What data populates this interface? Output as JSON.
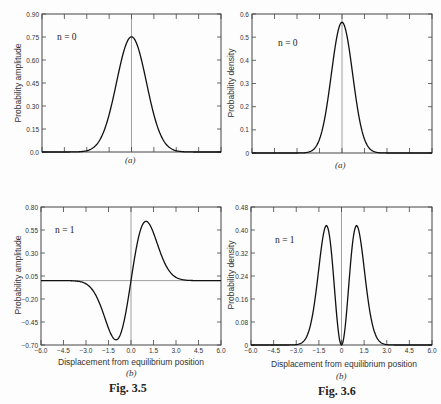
{
  "figures": {
    "left": {
      "caption": "Fig. 3.5"
    },
    "right": {
      "caption": "Fig. 3.6"
    }
  },
  "chart_data": [
    {
      "id": "fig3_5a",
      "type": "line",
      "panel": "(a)",
      "annotation": "n = 0",
      "xlabel": "",
      "ylabel": "Probability amplitude",
      "xlim": [
        -6.0,
        6.0
      ],
      "ylim": [
        0.0,
        0.9
      ],
      "yticks": [
        "0.0",
        "0.15",
        "0.30",
        "0.45",
        "0.60",
        "0.75",
        "0.90"
      ],
      "xticks": [
        -6.0,
        -4.5,
        -3.0,
        -1.5,
        0.0,
        1.5,
        3.0,
        4.5,
        6.0
      ],
      "xtick_labels_visible": false,
      "series": [
        {
          "name": "psi_0",
          "function": "0.7511*exp(-x^2/2)",
          "peak": {
            "x": 0.0,
            "y": 0.75
          },
          "x": [
            -4.0,
            -3.0,
            -2.5,
            -2.0,
            -1.5,
            -1.0,
            -0.5,
            0.0,
            0.5,
            1.0,
            1.5,
            2.0,
            2.5,
            3.0,
            4.0
          ],
          "values": [
            0.0,
            0.01,
            0.03,
            0.1,
            0.24,
            0.46,
            0.66,
            0.75,
            0.66,
            0.46,
            0.24,
            0.1,
            0.03,
            0.01,
            0.0
          ]
        }
      ],
      "reference_lines": [
        {
          "orientation": "vertical",
          "x": 0.0
        }
      ],
      "grid": false
    },
    {
      "id": "fig3_6a",
      "type": "line",
      "panel": "(a)",
      "annotation": "n = 0",
      "xlabel": "",
      "ylabel": "Probability density",
      "xlim": [
        -6.0,
        6.0
      ],
      "ylim": [
        0.0,
        0.6
      ],
      "yticks": [
        "0",
        "0.1",
        "0.2",
        "0.3",
        "0.4",
        "0.5",
        "0.6"
      ],
      "xticks": [
        -6.0,
        -4.5,
        -3.0,
        -1.5,
        0.0,
        1.5,
        3.0,
        4.5,
        6.0
      ],
      "xtick_labels_visible": false,
      "series": [
        {
          "name": "psi_0^2",
          "function": "0.5642*exp(-x^2)",
          "peak": {
            "x": 0.0,
            "y": 0.56
          },
          "x": [
            -3.0,
            -2.0,
            -1.5,
            -1.0,
            -0.5,
            0.0,
            0.5,
            1.0,
            1.5,
            2.0,
            3.0
          ],
          "values": [
            0.0,
            0.01,
            0.06,
            0.21,
            0.44,
            0.56,
            0.44,
            0.21,
            0.06,
            0.01,
            0.0
          ]
        }
      ],
      "reference_lines": [
        {
          "orientation": "vertical",
          "x": 0.0
        }
      ],
      "grid": false
    },
    {
      "id": "fig3_5b",
      "type": "line",
      "panel": "(b)",
      "annotation": "n = 1",
      "xlabel": "Displacement from equilibrium position",
      "ylabel": "Probability amplitude",
      "xlim": [
        -6.0,
        6.0
      ],
      "ylim": [
        -0.7,
        0.8
      ],
      "yticks": [
        "-0.70",
        "-0.45",
        "-0.20",
        "0.05",
        "0.30",
        "0.55",
        "0.80"
      ],
      "xticks": [
        "-6.0",
        "-4.5",
        "-3.0",
        "-1.5",
        "0.0",
        "1.5",
        "3.0",
        "4.5",
        "6.0"
      ],
      "series": [
        {
          "name": "psi_1",
          "function": "1.0623*x*exp(-x^2/2)",
          "min": {
            "x": -1.0,
            "y": -0.64
          },
          "max": {
            "x": 1.0,
            "y": 0.64
          },
          "x": [
            -4.0,
            -3.0,
            -2.5,
            -2.0,
            -1.5,
            -1.0,
            -0.5,
            0.0,
            0.5,
            1.0,
            1.5,
            2.0,
            2.5,
            3.0,
            4.0
          ],
          "values": [
            0.0,
            -0.04,
            -0.12,
            -0.29,
            -0.52,
            -0.64,
            -0.47,
            0.0,
            0.47,
            0.64,
            0.52,
            0.29,
            0.12,
            0.04,
            0.0
          ]
        }
      ],
      "reference_lines": [
        {
          "orientation": "vertical",
          "x": 0.0
        },
        {
          "orientation": "horizontal",
          "y": 0.0
        }
      ],
      "grid": false
    },
    {
      "id": "fig3_6b",
      "type": "line",
      "panel": "(b)",
      "annotation": "n = 1",
      "xlabel": "Displacement from equilibrium position",
      "ylabel": "Probability density",
      "xlim": [
        -6.0,
        6.0
      ],
      "ylim": [
        0.0,
        0.48
      ],
      "yticks": [
        "0",
        "0.08",
        "0.16",
        "0.24",
        "0.32",
        "0.40",
        "0.48"
      ],
      "xticks": [
        "-6.0",
        "-4.5",
        "-3.0",
        "-1.5",
        "0",
        "1.5",
        "3.0",
        "4.5",
        "6.0"
      ],
      "series": [
        {
          "name": "psi_1^2",
          "function": "1.1284*x^2*exp(-x^2)",
          "peaks": [
            {
              "x": -1.0,
              "y": 0.415
            },
            {
              "x": 1.0,
              "y": 0.415
            }
          ],
          "x": [
            -3.0,
            -2.5,
            -2.0,
            -1.5,
            -1.0,
            -0.5,
            0.0,
            0.5,
            1.0,
            1.5,
            2.0,
            2.5,
            3.0
          ],
          "values": [
            0.0,
            0.01,
            0.08,
            0.27,
            0.415,
            0.22,
            0.0,
            0.22,
            0.415,
            0.27,
            0.08,
            0.01,
            0.0
          ]
        }
      ],
      "reference_lines": [
        {
          "orientation": "vertical",
          "x": 0.0
        }
      ],
      "grid": false
    }
  ]
}
